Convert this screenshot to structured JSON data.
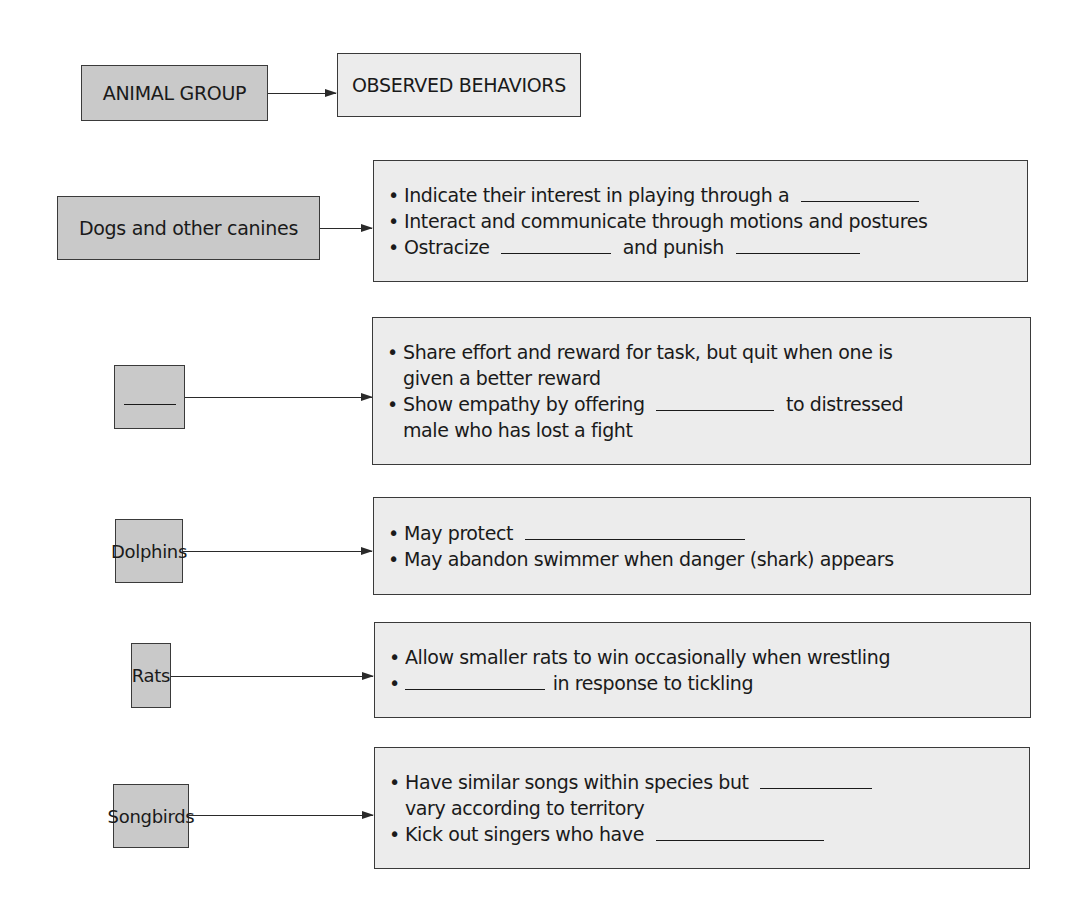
{
  "header": {
    "group_label": "ANIMAL GROUP",
    "behaviors_label": "OBSERVED BEHAVIORS"
  },
  "rows": [
    {
      "group": "Dogs and other canines",
      "behaviors": [
        {
          "text_before": "Indicate their interest in playing through a",
          "blank": true,
          "text_after": ""
        },
        {
          "text_before": "Interact and communicate through motions and postures"
        },
        {
          "text_before": "Ostracize",
          "blank": true,
          "text_mid": "and punish",
          "blank2": true
        }
      ]
    },
    {
      "group": "",
      "group_is_blank": true,
      "behaviors": [
        {
          "line1": "Share effort and reward for task, but quit when one is",
          "line2": "given a better reward"
        },
        {
          "text_before": "Show empathy by offering",
          "blank": true,
          "text_after": "to distressed",
          "line2": "male who has lost a fight"
        }
      ]
    },
    {
      "group": "Dolphins",
      "behaviors": [
        {
          "text_before": "May protect",
          "blank": true
        },
        {
          "text_before": "May abandon swimmer when danger (shark) appears"
        }
      ]
    },
    {
      "group": "Rats",
      "behaviors": [
        {
          "text_before": "Allow smaller rats to win occasionally when wrestling"
        },
        {
          "blank": true,
          "text_after": "in response to tickling"
        }
      ]
    },
    {
      "group": "Songbirds",
      "behaviors": [
        {
          "text_before": "Have similar songs within species but",
          "blank": true,
          "line2": "vary according to territory"
        },
        {
          "text_before": "Kick out singers who have",
          "blank": true
        }
      ]
    }
  ],
  "colors": {
    "group_fill": "#c9c9c9",
    "behavior_fill": "#ececec",
    "border": "#3a3a3a",
    "text": "#1a1a1a"
  }
}
